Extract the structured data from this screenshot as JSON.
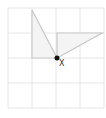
{
  "diagram": {
    "grid": {
      "x0": 8,
      "y0": 8,
      "x1": 104,
      "y1": 108,
      "cols": 4,
      "rows": 4,
      "color": "#e6e6e6"
    },
    "triangles": [
      {
        "name": "triangle-left",
        "points": [
          [
            32,
            10
          ],
          [
            32,
            58
          ],
          [
            57,
            58
          ]
        ],
        "stroke": "#c8c8c8",
        "fill": "#f4f4f4"
      },
      {
        "name": "triangle-right",
        "points": [
          [
            57,
            33
          ],
          [
            102,
            33
          ],
          [
            57,
            58
          ]
        ],
        "stroke": "#c8c8c8",
        "fill": "#f4f4f4"
      }
    ],
    "point": {
      "x": 57,
      "y": 58,
      "r": 2.5,
      "color": "#111111",
      "label": "X"
    }
  }
}
